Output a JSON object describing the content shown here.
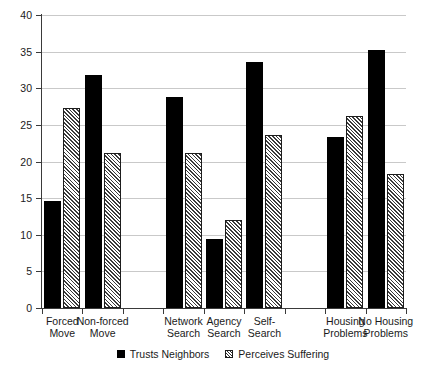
{
  "chart_data": {
    "type": "bar",
    "title": "",
    "subtitle": "",
    "xlabel": "",
    "ylabel": "",
    "ylim": [
      0,
      40
    ],
    "yticks": [
      0,
      5,
      10,
      15,
      20,
      25,
      30,
      35,
      40
    ],
    "ytick_labels": [
      "0",
      "5",
      "10",
      "15",
      "20",
      "25",
      "30",
      "35",
      "40"
    ],
    "grid": "horizontal",
    "legend_position": "bottom-center",
    "categories": [
      "Forced Move",
      "Non-forced Move",
      "Network Search",
      "Agency Search",
      "Self-Search",
      "Housing Problems",
      "No Housing Problems"
    ],
    "category_lines": [
      [
        "Forced",
        "Move"
      ],
      [
        "Non-forced",
        "Move"
      ],
      [
        "Network",
        "Search"
      ],
      [
        "Agency",
        "Search"
      ],
      [
        "Self-",
        "Search"
      ],
      [
        "Housing",
        "Problems"
      ],
      [
        "No Housing",
        "Problems"
      ]
    ],
    "series": [
      {
        "name": "Trusts Neighbors",
        "fill": "solid-black",
        "color": "#000000",
        "values": [
          14.6,
          31.8,
          28.8,
          9.4,
          33.6,
          23.3,
          35.2
        ]
      },
      {
        "name": "Perceives Suffering",
        "fill": "diagonal-hatch",
        "color": "#3b3b3b",
        "values": [
          27.3,
          21.2,
          21.2,
          12.0,
          23.6,
          26.2,
          18.3
        ]
      }
    ],
    "group_gaps_after": [
      1,
      4
    ]
  },
  "legend": {
    "entries": [
      {
        "label": "Trusts Neighbors"
      },
      {
        "label": "Perceives Suffering"
      }
    ]
  }
}
